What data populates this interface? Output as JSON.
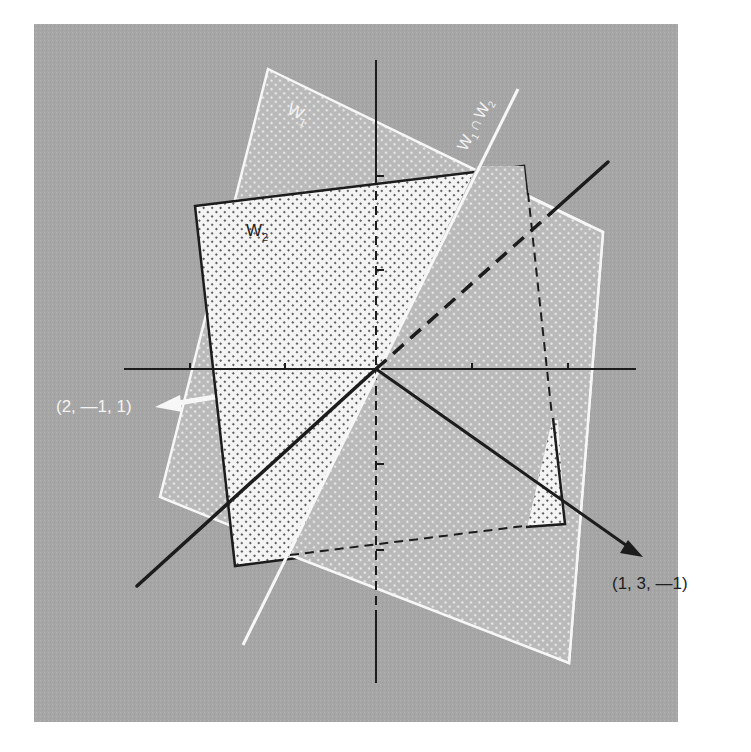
{
  "figure": {
    "background_color": "#ffffff",
    "panel_color": "#a8a8a8",
    "w1_fill": "#c4c4c4",
    "w2_fill": "#f2f2f2",
    "line_color": "#1c1c1c",
    "highlight_color": "#f7f7f7"
  },
  "labels": {
    "w1": "W",
    "w1_sub": "1",
    "w2": "W",
    "w2_sub": "2",
    "intersection_a": "W",
    "intersection_a_sub": "1",
    "intersection_cap": "∩",
    "intersection_b": "W",
    "intersection_b_sub": "2",
    "vector_left": "(2, —1, 1)",
    "vector_right": "(1, 3, —1)"
  },
  "elements": {
    "plane_w1": "Plane W1",
    "plane_w2": "Plane W2",
    "intersection_line": "W1 ∩ W2",
    "normal_w1": "(2, -1, 1)",
    "normal_w2": "(1, 3, -1)"
  }
}
